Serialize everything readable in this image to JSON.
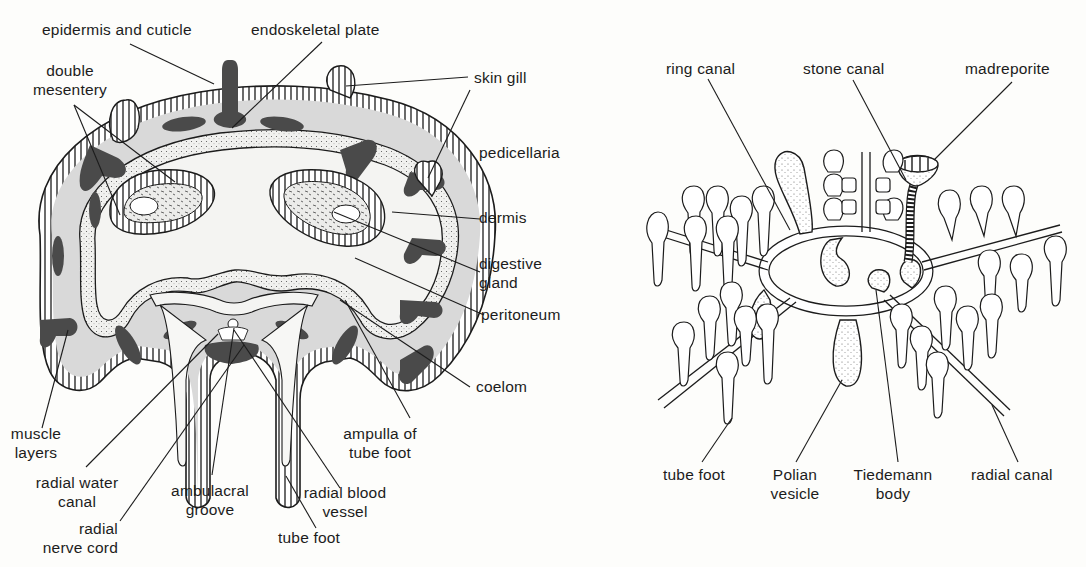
{
  "figure": {
    "left_panel": {
      "title": "Starfish arm cross-section",
      "labels": {
        "epidermis": "epidermis and cuticle",
        "endoskeletal_plate": "endoskeletal plate",
        "double_mesentery_1": "double",
        "double_mesentery_2": "mesentery",
        "skin_gill": "skin gill",
        "pedicellaria": "pedicellaria",
        "dermis": "dermis",
        "digestive_gland_1": "digestive",
        "digestive_gland_2": "gland",
        "peritoneum": "peritoneum",
        "coelom": "coelom",
        "muscle_layers_1": "muscle",
        "muscle_layers_2": "layers",
        "ampulla_1": "ampulla of",
        "ampulla_2": "tube foot",
        "radial_water_canal_1": "radial water",
        "radial_water_canal_2": "canal",
        "ambulacral_groove_1": "ambulacral",
        "ambulacral_groove_2": "groove",
        "radial_blood_vessel_1": "radial blood",
        "radial_blood_vessel_2": "vessel",
        "radial_nerve_cord_1": "radial",
        "radial_nerve_cord_2": "nerve cord",
        "tube_foot": "tube foot"
      }
    },
    "right_panel": {
      "title": "Water vascular system",
      "labels": {
        "ring_canal": "ring canal",
        "stone_canal": "stone canal",
        "madreporite": "madreporite",
        "tube_foot": "tube foot",
        "polian_vesicle_1": "Polian",
        "polian_vesicle_2": "vesicle",
        "tiedemann_body_1": "Tiedemann",
        "tiedemann_body_2": "body",
        "radial_canal": "radial canal"
      }
    },
    "colors": {
      "background": "#fdfdfb",
      "ink": "#1c1c1c",
      "dermis_fill": "#d9d9d9",
      "plate_fill": "#4a4a4a",
      "coelom_fill": "#f2f2f0"
    }
  }
}
